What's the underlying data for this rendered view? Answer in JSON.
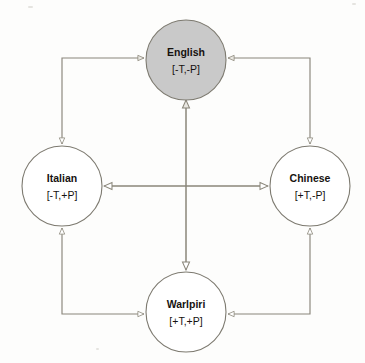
{
  "diagram": {
    "background_color": "#fdfdfc",
    "edge_color": "#8a867a",
    "node_stroke_color": "#7d7a70",
    "highlight_fill": "#c9c9c9",
    "plain_fill": "#ffffff",
    "nodes": [
      {
        "id": "english",
        "label": "English",
        "features": "[-T,-P]",
        "position": "top",
        "cx": 186,
        "cy": 60,
        "r": 40,
        "fill": "#c9c9c9",
        "highlighted": "true"
      },
      {
        "id": "italian",
        "label": "Italian",
        "features": "[-T,+P]",
        "position": "left",
        "cx": 62,
        "cy": 186,
        "r": 40,
        "fill": "#ffffff",
        "highlighted": "false"
      },
      {
        "id": "chinese",
        "label": "Chinese",
        "features": "[+T,-P]",
        "position": "right",
        "cx": 310,
        "cy": 186,
        "r": 40,
        "fill": "#ffffff",
        "highlighted": "false"
      },
      {
        "id": "warlpiri",
        "label": "Warlpiri",
        "features": "[+T,+P]",
        "position": "bottom",
        "cx": 186,
        "cy": 312,
        "r": 40,
        "fill": "#ffffff",
        "highlighted": "false"
      }
    ],
    "edges": [
      {
        "id": "english-italian",
        "from": "English",
        "to": "Italian",
        "shape": "elbow",
        "direction": "bidirectional"
      },
      {
        "id": "english-chinese",
        "from": "English",
        "to": "Chinese",
        "shape": "elbow",
        "direction": "bidirectional"
      },
      {
        "id": "italian-warlpiri",
        "from": "Italian",
        "to": "Warlpiri",
        "shape": "elbow",
        "direction": "bidirectional"
      },
      {
        "id": "chinese-warlpiri",
        "from": "Chinese",
        "to": "Warlpiri",
        "shape": "elbow",
        "direction": "bidirectional"
      },
      {
        "id": "english-warlpiri",
        "from": "English",
        "to": "Warlpiri",
        "shape": "straight-vertical",
        "direction": "bidirectional"
      },
      {
        "id": "italian-chinese",
        "from": "Italian",
        "to": "Chinese",
        "shape": "straight-horizontal",
        "direction": "bidirectional"
      }
    ]
  }
}
